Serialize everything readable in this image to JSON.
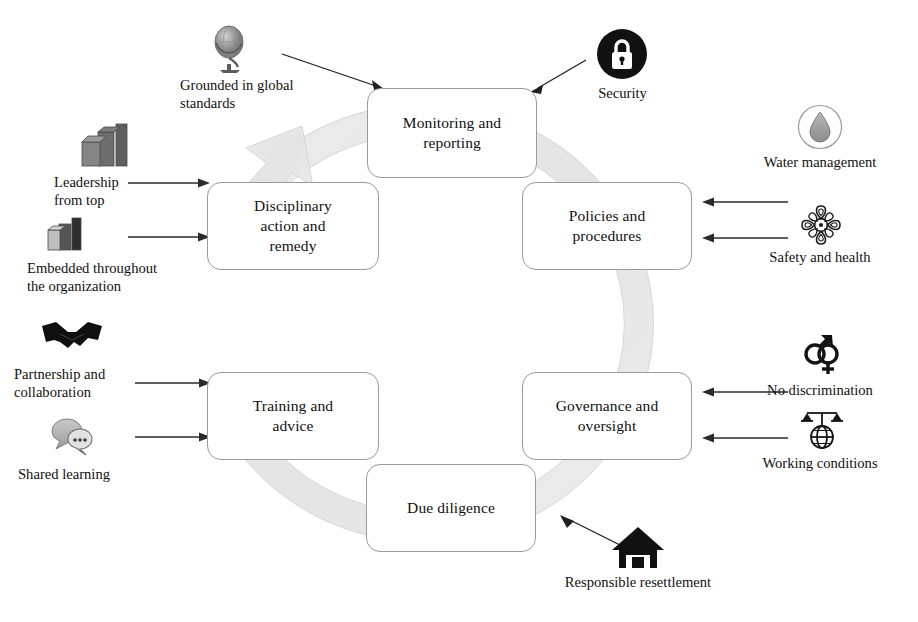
{
  "diagram": {
    "cycle_direction": "clockwise",
    "ring_color": "#e9e9e9",
    "box_border_color": "#9a9a9a",
    "accent_color": "#111111",
    "nodes": [
      {
        "id": "monitoring",
        "label": "Monitoring and\nreporting",
        "position": "top"
      },
      {
        "id": "policies",
        "label": "Policies and\nprocedures",
        "position": "top-right"
      },
      {
        "id": "governance",
        "label": "Governance and\noversight",
        "position": "bottom-right"
      },
      {
        "id": "duediligence",
        "label": "Due diligence",
        "position": "bottom"
      },
      {
        "id": "training",
        "label": "Training and\nadvice",
        "position": "bottom-left"
      },
      {
        "id": "disciplinary",
        "label": "Disciplinary\naction and\nremedy",
        "position": "top-left"
      }
    ],
    "left_items": [
      {
        "id": "leadership",
        "label": "Leadership\nfrom top",
        "icon": "building-blocks-icon",
        "target": "disciplinary"
      },
      {
        "id": "embedded",
        "label": "Embedded throughout\nthe organization",
        "icon": "building-blocks-small-icon",
        "target": "disciplinary"
      },
      {
        "id": "partnership",
        "label": "Partnership and\ncollaboration",
        "icon": "handshake-icon",
        "target": "training"
      },
      {
        "id": "shared",
        "label": "Shared learning",
        "icon": "speech-bubbles-icon",
        "target": "training"
      }
    ],
    "right_items": [
      {
        "id": "water",
        "label": "Water management",
        "icon": "water-drop-icon",
        "target": "policies"
      },
      {
        "id": "safety",
        "label": "Safety and health",
        "icon": "medallion-icon",
        "target": "policies"
      },
      {
        "id": "nodiscrim",
        "label": "No discrimination",
        "icon": "gender-symbols-icon",
        "target": "governance"
      },
      {
        "id": "working",
        "label": "Working conditions",
        "icon": "scales-globe-icon",
        "target": "governance"
      }
    ],
    "top_items": [
      {
        "id": "grounded",
        "label": "Grounded in global\nstandards",
        "icon": "globe-icon",
        "target": "monitoring"
      },
      {
        "id": "security",
        "label": "Security",
        "icon": "padlock-icon",
        "target": "monitoring"
      }
    ],
    "bottom_items": [
      {
        "id": "resettlement",
        "label": "Responsible resettlement",
        "icon": "house-icon",
        "target": "duediligence"
      }
    ]
  }
}
